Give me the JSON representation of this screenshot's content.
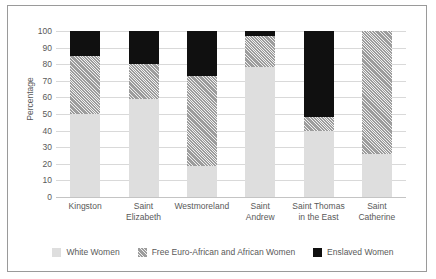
{
  "chart_data": {
    "type": "bar",
    "subtype": "stacked-bar-100",
    "title": "",
    "xlabel": "",
    "ylabel": "Percentage",
    "ylim": [
      0,
      100
    ],
    "yticks": [
      0,
      10,
      20,
      30,
      40,
      50,
      60,
      70,
      80,
      90,
      100
    ],
    "grid": true,
    "legend_position": "bottom",
    "categories": [
      "Kingston",
      "Saint Elizabeth",
      "Westmoreland",
      "Saint Andrew",
      "Saint Thomas in the East",
      "Saint Catherine"
    ],
    "category_lines": [
      [
        "Kingston"
      ],
      [
        "Saint",
        "Elizabeth"
      ],
      [
        "Westmoreland"
      ],
      [
        "Saint",
        "Andrew"
      ],
      [
        "Saint Thomas",
        "in the East"
      ],
      [
        "Saint",
        "Catherine"
      ]
    ],
    "series": [
      {
        "name": "White Women",
        "color": "#dedede",
        "pattern": "solid",
        "values": [
          50,
          59,
          18.5,
          78.5,
          40,
          26
        ]
      },
      {
        "name": "Free Euro-African and African Women",
        "color": "#9d9d9d",
        "pattern": "diagonal-hatch",
        "values": [
          35,
          21,
          54.5,
          18.5,
          8,
          74
        ]
      },
      {
        "name": "Enslaved Women",
        "color": "#101010",
        "pattern": "solid",
        "values": [
          15,
          20,
          27,
          3,
          52,
          0
        ]
      }
    ]
  },
  "legend": {
    "items": [
      {
        "label": "White Women",
        "swatch": "white-women-swatch"
      },
      {
        "label": "Free Euro-African and African Women",
        "swatch": "free-women-swatch"
      },
      {
        "label": "Enslaved Women",
        "swatch": "enslaved-women-swatch"
      }
    ]
  },
  "axis": {
    "y_title": "Percentage",
    "y_tick_labels": [
      "100",
      "90",
      "80",
      "70",
      "60",
      "50",
      "40",
      "30",
      "20",
      "10",
      "0"
    ]
  }
}
